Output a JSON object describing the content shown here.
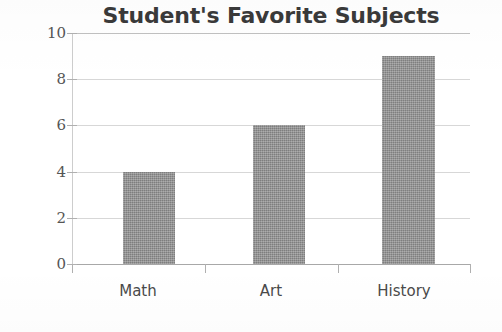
{
  "chart_data": {
    "type": "bar",
    "title": "Student's Favorite Subjects",
    "xlabel": "",
    "ylabel": "",
    "categories": [
      "Math",
      "Art",
      "History"
    ],
    "values": [
      4,
      6,
      9
    ],
    "ylim": [
      0,
      10
    ],
    "yticks": [
      0,
      2,
      4,
      6,
      8,
      10
    ],
    "ytick_labels": [
      "0",
      "2",
      "4",
      "6",
      "8",
      "10"
    ],
    "grid": true,
    "grid_axis": "y",
    "legend": false,
    "bar_color": "#8c8c8c",
    "title_color": "#3a3a3a",
    "axis_color": "#a8a8a8",
    "gridline_color": "#c9c9c9",
    "background_color": "#ffffff"
  },
  "ticks": {
    "t0": "0",
    "t1": "2",
    "t2": "4",
    "t3": "6",
    "t4": "8",
    "t5": "10"
  },
  "categories": {
    "c0": "Math",
    "c1": "Art",
    "c2": "History"
  }
}
